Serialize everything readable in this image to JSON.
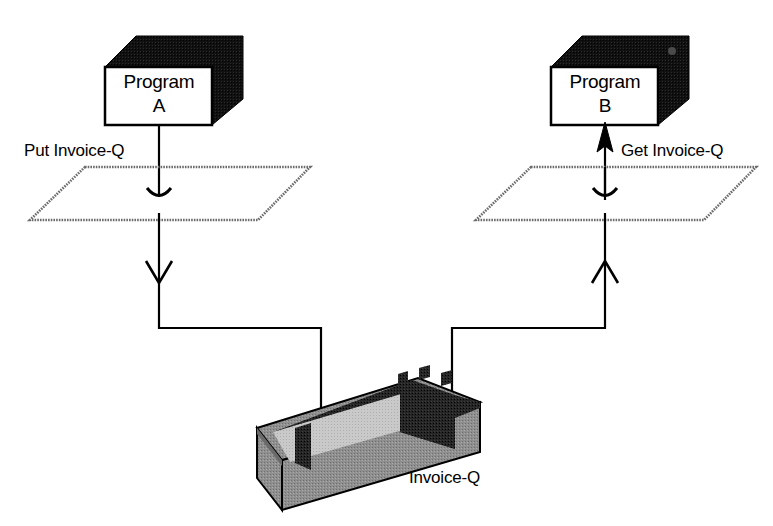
{
  "diagram": {
    "colors": {
      "background": "#ffffff",
      "stroke": "#000000",
      "box_fill": "#ffffff",
      "box_shadow": "#1a1a1a",
      "queue_outer": "#8a8a8a",
      "queue_inner": "#262626",
      "queue_floor": "#d0d0d0"
    },
    "nodes": {
      "program_a": {
        "line1": "Program",
        "line2": "A",
        "shape": "3d-box"
      },
      "program_b": {
        "line1": "Program",
        "line2": "B",
        "shape": "3d-box"
      },
      "queue": {
        "label": "Invoice-Q",
        "shape": "3d-open-bin"
      },
      "boundary_left": {
        "shape": "parallelogram-plane"
      },
      "boundary_right": {
        "shape": "parallelogram-plane"
      }
    },
    "edges": {
      "put": {
        "label": "Put Invoice-Q",
        "direction": "down",
        "from": "program_a",
        "to": "queue"
      },
      "get": {
        "label": "Get Invoice-Q",
        "direction": "up",
        "from": "queue",
        "to": "program_b"
      }
    },
    "icons": {
      "arrow_down_open": "arrow-down-open-icon",
      "arrow_up_open": "arrow-up-open-icon",
      "arrow_up_solid": "arrow-up-solid-icon",
      "arrow_pierce_plane": "arrow-pierce-plane-icon"
    }
  }
}
